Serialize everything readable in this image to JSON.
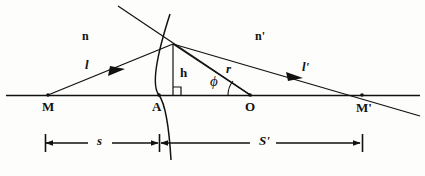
{
  "figure": {
    "kind": "optics-refraction-spherical-surface",
    "background_color": "#fdfdfb",
    "ink_color": "#111111"
  },
  "labels": {
    "medium_left": "n",
    "medium_right": "n'",
    "incident_ray": "l",
    "refracted_ray": "l'",
    "object_point": "M",
    "image_point": "M'",
    "vertex_point": "A",
    "center_of_curvature": "O",
    "height": "h",
    "radius": "r",
    "angle": "ϕ",
    "object_distance": "s",
    "image_distance": "S'"
  },
  "geometry": {
    "axis_y": 95,
    "axis_x_start": 6,
    "axis_x_end": 420,
    "point_M": {
      "x": 48,
      "y": 95
    },
    "point_A": {
      "x": 159,
      "y": 95
    },
    "point_O": {
      "x": 250,
      "y": 95
    },
    "point_M_prime": {
      "x": 362,
      "y": 95
    },
    "point_P": {
      "x": 173,
      "y": 44
    },
    "normal_top": {
      "x": 118,
      "y": 6
    },
    "refracted_tail": {
      "x": 420,
      "y": 116
    },
    "dim_y": 143,
    "dim_left_tick": 45,
    "dim_mid_tick": 159,
    "dim_right_tick": 362
  },
  "label_positions": {
    "medium_left": {
      "x": 82,
      "y": 30
    },
    "medium_right": {
      "x": 255,
      "y": 30
    },
    "incident_ray": {
      "x": 85,
      "y": 58
    },
    "refracted_ray": {
      "x": 302,
      "y": 60
    },
    "object_point": {
      "x": 42,
      "y": 100
    },
    "image_point": {
      "x": 356,
      "y": 101
    },
    "vertex_point": {
      "x": 152,
      "y": 100
    },
    "center_of_curvature": {
      "x": 245,
      "y": 100
    },
    "height": {
      "x": 180,
      "y": 66
    },
    "radius": {
      "x": 226,
      "y": 62
    },
    "angle": {
      "x": 210,
      "y": 76
    },
    "object_distance": {
      "x": 98,
      "y": 133
    },
    "image_distance": {
      "x": 262,
      "y": 133
    }
  }
}
